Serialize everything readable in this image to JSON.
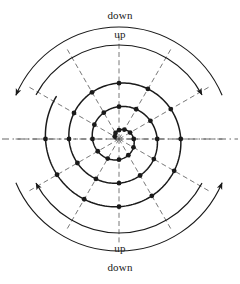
{
  "figure": {
    "type": "spiral-diagram",
    "title": "",
    "background_color": "#ffffff",
    "stroke_color": "#1a1a1a",
    "dash_color": "#555555",
    "center": {
      "x": 119,
      "y": 139
    },
    "labels": {
      "down_top": "down",
      "up_top": "up",
      "up_bottom": "up",
      "down_bottom": "down"
    },
    "arcs": [
      {
        "name": "down-arc-top",
        "label": "down",
        "radius": 112,
        "start_deg": 203,
        "end_deg": 337,
        "arrow_at": "start",
        "arrow_direction": "counterclockwise"
      },
      {
        "name": "up-arc-top",
        "label": "up",
        "radius": 94,
        "start_deg": 208,
        "end_deg": 332,
        "arrow_at": "end",
        "arrow_direction": "clockwise"
      },
      {
        "name": "up-arc-bottom",
        "label": "up",
        "radius": 94,
        "start_deg": 28,
        "end_deg": 152,
        "arrow_at": "end",
        "arrow_direction": "counterclockwise"
      },
      {
        "name": "down-arc-bottom",
        "label": "down",
        "radius": 112,
        "start_deg": 23,
        "end_deg": 157,
        "arrow_at": "start",
        "arrow_direction": "clockwise"
      }
    ],
    "spokes": {
      "count": 12,
      "step_deg": 30,
      "style": "dashed",
      "inner_radius": 0,
      "outer_radius": 105
    },
    "spiral": {
      "kind": "archimedean",
      "turns": 3,
      "r_start": 3,
      "r_per_turn": 23.5,
      "r_end": 74,
      "node_count": 36,
      "node_radius_px": 2.4
    },
    "axis": {
      "horizontal_dashed_line": true,
      "x_start": 2,
      "x_end": 238,
      "y": 139
    }
  }
}
